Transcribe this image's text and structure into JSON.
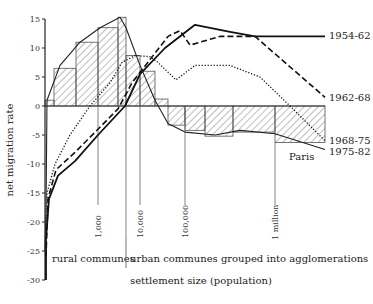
{
  "chart_data": {
    "type": "line",
    "title": "",
    "xlabel": "settlement size (population)",
    "ylabel": "net migration rate",
    "ylim": [
      -30,
      15
    ],
    "yticks": [
      15,
      10,
      5,
      0,
      -5,
      -10,
      -15,
      -20,
      -25,
      -30
    ],
    "x_scale": "log settlement size (pixel position used as x)",
    "x_reference_lines": [
      {
        "label": "1,000",
        "x": 98
      },
      {
        "label": "10,000",
        "x": 140
      },
      {
        "label": "100,000",
        "x": 185
      },
      {
        "label": "1 million",
        "x": 275
      }
    ],
    "group_divider_x": 126,
    "group_labels": [
      {
        "label": "rural communes"
      },
      {
        "label": "urban communes grouped into agglomerations"
      }
    ],
    "histogram": {
      "name": "1975-82 (bars)",
      "bars": [
        {
          "x0": 45,
          "x1": 54,
          "value": 1.0
        },
        {
          "x0": 54,
          "x1": 76,
          "value": 6.5
        },
        {
          "x0": 76,
          "x1": 98,
          "value": 11.0
        },
        {
          "x0": 98,
          "x1": 118,
          "value": 13.5
        },
        {
          "x0": 118,
          "x1": 126,
          "value": 15.3
        },
        {
          "x0": 126,
          "x1": 140,
          "value": 8.7
        },
        {
          "x0": 140,
          "x1": 155,
          "value": 6.0
        },
        {
          "x0": 155,
          "x1": 168,
          "value": 1.2
        },
        {
          "x0": 168,
          "x1": 185,
          "value": -3.3
        },
        {
          "x0": 185,
          "x1": 205,
          "value": -4.2
        },
        {
          "x0": 205,
          "x1": 233,
          "value": -5.2
        },
        {
          "x0": 233,
          "x1": 275,
          "value": -4.5
        },
        {
          "x0": 275,
          "x1": 325,
          "value": -6.3
        }
      ]
    },
    "series": [
      {
        "name": "1954-62",
        "style": "solid",
        "points": [
          [
            46,
            -30
          ],
          [
            46,
            -23
          ],
          [
            49,
            -16
          ],
          [
            58,
            -12
          ],
          [
            75,
            -9.5
          ],
          [
            98,
            -5
          ],
          [
            125,
            0
          ],
          [
            140,
            5.5
          ],
          [
            165,
            10
          ],
          [
            195,
            14
          ],
          [
            230,
            12.8
          ],
          [
            255,
            12
          ],
          [
            325,
            12
          ]
        ]
      },
      {
        "name": "1962-68",
        "style": "dashed",
        "points": [
          [
            46,
            -26
          ],
          [
            48,
            -16
          ],
          [
            56,
            -11
          ],
          [
            75,
            -8
          ],
          [
            98,
            -4
          ],
          [
            118,
            -0.5
          ],
          [
            132,
            4
          ],
          [
            150,
            8
          ],
          [
            168,
            12
          ],
          [
            180,
            13
          ],
          [
            190,
            10.5
          ],
          [
            220,
            12
          ],
          [
            255,
            12
          ],
          [
            325,
            1.5
          ]
        ]
      },
      {
        "name": "1968-75",
        "style": "dotted",
        "points": [
          [
            46,
            -22
          ],
          [
            47,
            -15
          ],
          [
            55,
            -10
          ],
          [
            70,
            -5
          ],
          [
            90,
            0
          ],
          [
            110,
            4
          ],
          [
            122,
            7.5
          ],
          [
            135,
            8.7
          ],
          [
            150,
            8.5
          ],
          [
            158,
            7.5
          ],
          [
            176,
            4.5
          ],
          [
            195,
            7
          ],
          [
            230,
            7
          ],
          [
            260,
            5
          ],
          [
            290,
            0
          ],
          [
            325,
            -6
          ]
        ]
      },
      {
        "name": "1975-82",
        "style": "solid-thin",
        "points": [
          [
            45,
            -25
          ],
          [
            46,
            -18
          ],
          [
            47,
            1
          ],
          [
            60,
            7
          ],
          [
            80,
            11
          ],
          [
            100,
            13.5
          ],
          [
            120,
            15.3
          ],
          [
            126,
            13.5
          ],
          [
            140,
            7
          ],
          [
            155,
            1
          ],
          [
            168,
            -3
          ],
          [
            185,
            -4.5
          ],
          [
            215,
            -5
          ],
          [
            240,
            -4.2
          ],
          [
            275,
            -4.8
          ],
          [
            325,
            -7.5
          ]
        ]
      }
    ],
    "annotations": [
      {
        "label": "Paris"
      }
    ]
  }
}
